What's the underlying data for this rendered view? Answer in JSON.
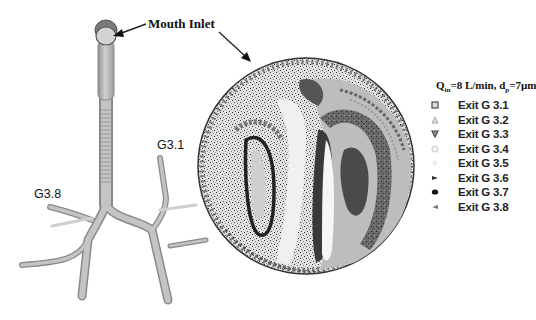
{
  "labels": {
    "mouth_inlet": "Mouth Inlet",
    "g31": "G3.1",
    "g38": "G3.8"
  },
  "condition": {
    "q_symbol": "Q",
    "q_sub": "in",
    "q_value": "=8 L/min, d",
    "d_sub": "p",
    "d_value": "=7µm"
  },
  "legend": [
    {
      "label": "Exit G 3.1",
      "marker": "square-outline",
      "color": "#555555"
    },
    {
      "label": "Exit G 3.2",
      "marker": "triangle-up",
      "color": "#aaaaaa"
    },
    {
      "label": "Exit G 3.3",
      "marker": "triangle-down",
      "color": "#444444"
    },
    {
      "label": "Exit G 3.4",
      "marker": "circle-outline",
      "color": "#cccccc"
    },
    {
      "label": "Exit G 3.5",
      "marker": "plus",
      "color": "#e6e6e6"
    },
    {
      "label": "Exit G 3.6",
      "marker": "triangle-right",
      "color": "#333333"
    },
    {
      "label": "Exit G 3.7",
      "marker": "filled-circle",
      "color": "#111111"
    },
    {
      "label": "Exit G 3.8",
      "marker": "triangle-left",
      "color": "#777777"
    }
  ],
  "colors": {
    "airway": "#b8b8b8",
    "airway_edge": "#8a8a8a",
    "disk_bg": "#d9d9d9"
  }
}
